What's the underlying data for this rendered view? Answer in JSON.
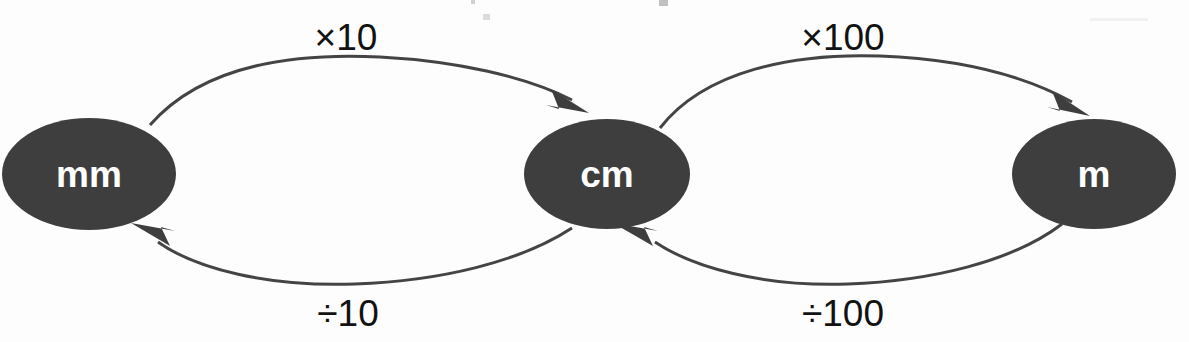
{
  "diagram": {
    "title_fragment_visible": "",
    "background_color": "#fdfdfd",
    "node_fill_color": "#3e3e3e",
    "node_text_color": "#ffffff",
    "edge_color": "#444444",
    "label_text_color": "#121212",
    "nodes": [
      {
        "id": "mm",
        "label": "mm",
        "cx": 89,
        "cy": 174,
        "rx": 87,
        "ry": 56
      },
      {
        "id": "cm",
        "label": "cm",
        "cx": 607,
        "cy": 174,
        "rx": 83,
        "ry": 55
      },
      {
        "id": "m",
        "label": "m",
        "cx": 1094,
        "cy": 174,
        "rx": 82,
        "ry": 55
      }
    ],
    "edges": [
      {
        "id": "mm-to-cm",
        "from": "mm",
        "to": "cm",
        "label": "×10",
        "label_x": 346,
        "label_y": 40,
        "direction": "right",
        "position": "top"
      },
      {
        "id": "cm-to-mm",
        "from": "cm",
        "to": "mm",
        "label": "÷10",
        "label_x": 348,
        "label_y": 316,
        "direction": "left",
        "position": "bottom"
      },
      {
        "id": "cm-to-m",
        "from": "cm",
        "to": "m",
        "label": "×100",
        "label_x": 843,
        "label_y": 40,
        "direction": "right",
        "position": "top"
      },
      {
        "id": "m-to-cm",
        "from": "m",
        "to": "cm",
        "label": "÷100",
        "label_x": 843,
        "label_y": 316,
        "direction": "left",
        "position": "bottom"
      }
    ]
  }
}
